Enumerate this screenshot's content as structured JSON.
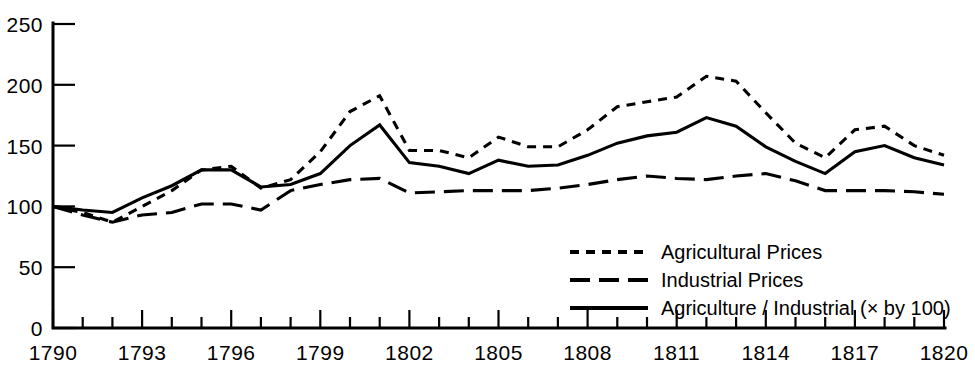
{
  "chart_data": {
    "type": "line",
    "title": "",
    "subtitle": "",
    "xlabel": "",
    "ylabel": "",
    "xlim": [
      1790,
      1820
    ],
    "ylim": [
      0,
      250
    ],
    "grid": false,
    "legend_position": "inside-bottom-right",
    "y_ticks": [
      "0",
      "50",
      "100",
      "150",
      "200",
      "250"
    ],
    "y_tick_values": [
      0,
      50,
      100,
      150,
      200,
      250
    ],
    "x_ticks": [
      "1790",
      "1793",
      "1796",
      "1799",
      "1802",
      "1805",
      "1808",
      "1811",
      "1814",
      "1817",
      "1820"
    ],
    "x_tick_values": [
      1790,
      1793,
      1796,
      1799,
      1802,
      1805,
      1808,
      1811,
      1814,
      1817,
      1820
    ],
    "x_minor_step": 1,
    "x": [
      1790,
      1791,
      1792,
      1793,
      1794,
      1795,
      1796,
      1797,
      1798,
      1799,
      1800,
      1801,
      1802,
      1803,
      1804,
      1805,
      1806,
      1807,
      1808,
      1809,
      1810,
      1811,
      1812,
      1813,
      1814,
      1815,
      1816,
      1817,
      1818,
      1819,
      1820
    ],
    "series": [
      {
        "name": "Agricultural Prices",
        "style": "dotted",
        "values": [
          100,
          95,
          87,
          100,
          113,
          130,
          133,
          115,
          122,
          145,
          178,
          191,
          146,
          146,
          140,
          157,
          149,
          149,
          163,
          182,
          186,
          190,
          207,
          203,
          177,
          152,
          140,
          163,
          166,
          150,
          142
        ]
      },
      {
        "name": "Industrial Prices",
        "style": "dashed",
        "values": [
          100,
          93,
          87,
          93,
          95,
          102,
          102,
          97,
          113,
          118,
          122,
          123,
          111,
          112,
          113,
          113,
          113,
          115,
          118,
          122,
          125,
          123,
          122,
          125,
          127,
          121,
          113,
          113,
          113,
          112,
          110
        ]
      },
      {
        "name": "Agriculture / Industrial (× by 100)",
        "style": "solid",
        "values": [
          100,
          97,
          95,
          107,
          117,
          130,
          130,
          116,
          118,
          127,
          150,
          167,
          136,
          133,
          127,
          138,
          133,
          134,
          142,
          152,
          158,
          161,
          173,
          166,
          149,
          137,
          127,
          145,
          150,
          140,
          134
        ]
      }
    ],
    "legend_entries": [
      {
        "label": "Agricultural Prices",
        "style": "dotted"
      },
      {
        "label": "Industrial Prices",
        "style": "dashed"
      },
      {
        "label": "Agriculture / Industrial (× by 100)",
        "style": "solid"
      }
    ]
  }
}
